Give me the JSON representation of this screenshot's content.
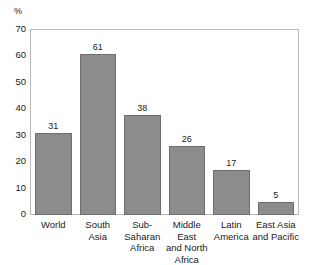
{
  "chart_data": {
    "type": "bar",
    "title": "",
    "subtitle": "",
    "xlabel": "",
    "ylabel": "%",
    "unit_label": "%",
    "categories": [
      "World",
      "South Asia",
      "Sub-Saharan Africa",
      "Middle East and North Africa",
      "Latin America",
      "East Asia and Pacific"
    ],
    "category_lines": [
      [
        "World"
      ],
      [
        "South",
        "Asia"
      ],
      [
        "Sub-",
        "Saharan",
        "Africa"
      ],
      [
        "Middle East",
        "and North",
        "Africa"
      ],
      [
        "Latin",
        "America"
      ],
      [
        "East Asia",
        "and Pacific"
      ]
    ],
    "values": [
      31,
      61,
      38,
      26,
      17,
      5
    ],
    "value_labels": [
      "31",
      "61",
      "38",
      "26",
      "17",
      "5"
    ],
    "ylim": [
      0,
      70
    ],
    "yticks": [
      0,
      10,
      20,
      30,
      40,
      50,
      60,
      70
    ],
    "ytick_labels": [
      "0",
      "10",
      "20",
      "30",
      "40",
      "50",
      "60",
      "70"
    ],
    "grid": false,
    "legend": null,
    "legend_position": "none",
    "bar_color": "#8c8c8c",
    "bar_edge_color": "#6e6e6e",
    "frame_color": "#b9b9b9",
    "text_color": "#1a1a1a"
  }
}
